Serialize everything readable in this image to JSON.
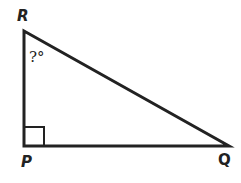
{
  "diagram": {
    "type": "right-triangle",
    "vertices": {
      "R": {
        "label": "R",
        "x": 24,
        "y": 31
      },
      "P": {
        "label": "P",
        "x": 24,
        "y": 146
      },
      "Q": {
        "label": "Q",
        "x": 229,
        "y": 146
      }
    },
    "right_angle_at": "P",
    "unknown_angle": {
      "at": "R",
      "label": "?°"
    },
    "stroke_color": "#222222",
    "background": "#ffffff"
  }
}
